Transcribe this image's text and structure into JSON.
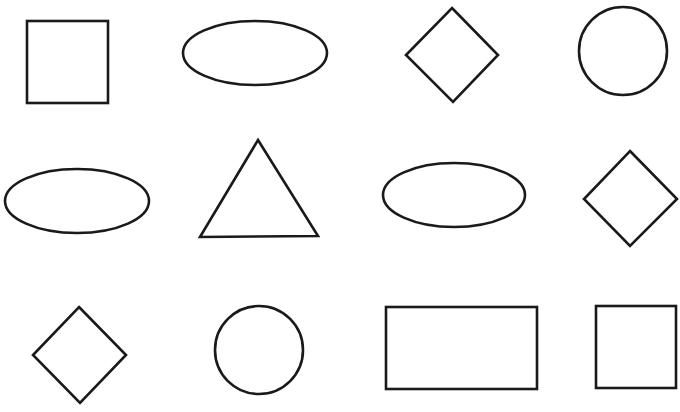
{
  "canvas": {
    "width": 680,
    "height": 412,
    "background": "#ffffff",
    "stroke": "#1a1a1a"
  },
  "shapes": [
    {
      "id": "square-1",
      "type": "square",
      "x": 27,
      "y": 21,
      "w": 81,
      "h": 82
    },
    {
      "id": "ellipse-1",
      "type": "ellipse",
      "cx": 255,
      "cy": 53,
      "rx": 72,
      "ry": 32
    },
    {
      "id": "diamond-1",
      "type": "diamond",
      "points": "452,8 498,55 453,102 406,55"
    },
    {
      "id": "circle-1",
      "type": "circle",
      "cx": 623,
      "cy": 51,
      "r": 44
    },
    {
      "id": "ellipse-2",
      "type": "ellipse",
      "cx": 77,
      "cy": 201,
      "rx": 72,
      "ry": 32
    },
    {
      "id": "triangle-1",
      "type": "triangle",
      "points": "258,140 318,236 200,237"
    },
    {
      "id": "ellipse-3",
      "type": "ellipse",
      "cx": 454,
      "cy": 195,
      "rx": 71,
      "ry": 32
    },
    {
      "id": "diamond-2",
      "type": "diamond",
      "points": "630,151 677,199 630,246 584,199"
    },
    {
      "id": "diamond-3",
      "type": "diamond",
      "points": "79,307 126,355 80,403 33,355"
    },
    {
      "id": "circle-2",
      "type": "circle",
      "cx": 259,
      "cy": 350,
      "r": 44
    },
    {
      "id": "rectangle-1",
      "type": "rectangle",
      "x": 386,
      "y": 307,
      "w": 151,
      "h": 82
    },
    {
      "id": "square-2",
      "type": "square",
      "x": 596,
      "y": 306,
      "w": 80,
      "h": 82
    }
  ]
}
